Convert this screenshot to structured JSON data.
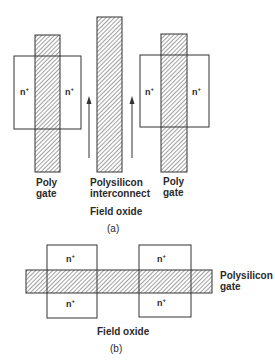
{
  "figure_a": {
    "caption": "(a)",
    "labels": {
      "left_gate": [
        "Poly",
        "gate"
      ],
      "interconnect": [
        "Polysilicon",
        "interconnect"
      ],
      "right_gate": [
        "Poly",
        "gate"
      ],
      "field_oxide": "Field oxide"
    },
    "regions": {
      "left_n_left": "n",
      "left_n_right": "n",
      "right_n_left": "n",
      "right_n_right": "n",
      "superscript": "+"
    }
  },
  "figure_b": {
    "caption": "(b)",
    "labels": {
      "gate": [
        "Polysilicon",
        "gate"
      ],
      "field_oxide": "Field oxide"
    },
    "regions": {
      "left_top": "n",
      "left_bottom": "n",
      "right_top": "n",
      "right_bottom": "n",
      "superscript": "+"
    }
  },
  "colors": {
    "line": "#333333",
    "hatch": "#444444",
    "background": "#ffffff"
  }
}
